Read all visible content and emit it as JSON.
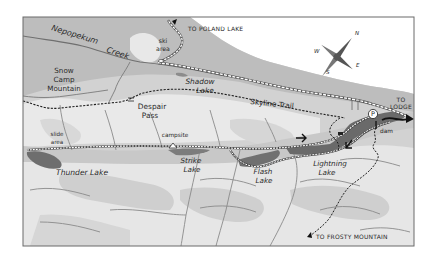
{
  "map": {
    "title": "Trail map",
    "colors": {
      "frame": "#6a6a6a",
      "forest": "#c4c4c4",
      "mountain_light": "#e6e6e6",
      "mountain_mid": "#d0d0d0",
      "lake": "#7a7a7a",
      "river": "#7f7f7f",
      "trail": "#222222",
      "road": "#ffffff",
      "paper": "#ffffff"
    },
    "labels": {
      "creek_1": "Nepopekum",
      "creek_2": "Creek",
      "ski_1": "ski",
      "ski_2": "area",
      "to_poland": "TO POLAND LAKE",
      "snow_1": "Snow",
      "snow_2": "Camp",
      "snow_3": "Mountain",
      "shadow_1": "Shadow",
      "shadow_2": "Lake",
      "skyline": "Skyline Trail",
      "despair_1": "Despair",
      "despair_2": "Pass",
      "slide_1": "slide",
      "slide_2": "area",
      "campsite": "campsite",
      "thunder": "Thunder Lake",
      "strike_1": "Strike",
      "strike_2": "Lake",
      "flash_1": "Flash",
      "flash_2": "Lake",
      "lightning_1": "Lightning",
      "lightning_2": "Lake",
      "dam": "dam",
      "to_lodge_1": "TO",
      "to_lodge_2": "LODGE",
      "to_frosty": "TO FROSTY MOUNTAIN",
      "parking": "P"
    },
    "compass": {
      "n": "N",
      "s": "S",
      "e": "E",
      "w": "W"
    }
  }
}
